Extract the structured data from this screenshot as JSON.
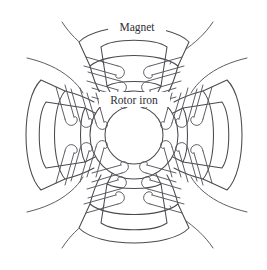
{
  "figure": {
    "name": "rotor-cross-section-diagram",
    "type": "technical-line-drawing",
    "background_color": "#ffffff",
    "stroke_color": "#4a4a50",
    "width": 267,
    "height": 270
  },
  "labels": {
    "magnet": "Magnet",
    "rotor_iron": "Rotor iron"
  },
  "label_positions": {
    "magnet": {
      "x": 137,
      "y": 30
    },
    "rotor_iron": {
      "x": 134,
      "y": 103
    }
  },
  "geometry": {
    "center": {
      "x": 134,
      "y": 135
    },
    "rotor_outer_radius": 44,
    "rotor_inner_radius": 29,
    "pole_count": 4,
    "pole_angles_deg": [
      270,
      0,
      90,
      180
    ],
    "magnet_arc_outer_radius": 110,
    "magnet_arc_inner_radius": 72,
    "magnet_arc_half_span_deg": 30,
    "winding_turns_per_side": 3,
    "lead_wire_count": 8
  },
  "components": [
    {
      "id": "rotor-iron-outer-circle",
      "label": "Rotor iron outer circle"
    },
    {
      "id": "rotor-iron-inner-circle",
      "label": "Rotor iron inner bore"
    },
    {
      "id": "magnet-pole-top",
      "label": "Magnet"
    },
    {
      "id": "magnet-pole-right",
      "label": "Magnet"
    },
    {
      "id": "magnet-pole-bottom",
      "label": "Magnet"
    },
    {
      "id": "magnet-pole-left",
      "label": "Magnet"
    },
    {
      "id": "winding-coil-top",
      "label": "Coil winding"
    },
    {
      "id": "winding-coil-right",
      "label": "Coil winding"
    },
    {
      "id": "winding-coil-bottom",
      "label": "Coil winding"
    },
    {
      "id": "winding-coil-left",
      "label": "Coil winding"
    },
    {
      "id": "lead-wires",
      "label": "Lead wires"
    }
  ]
}
